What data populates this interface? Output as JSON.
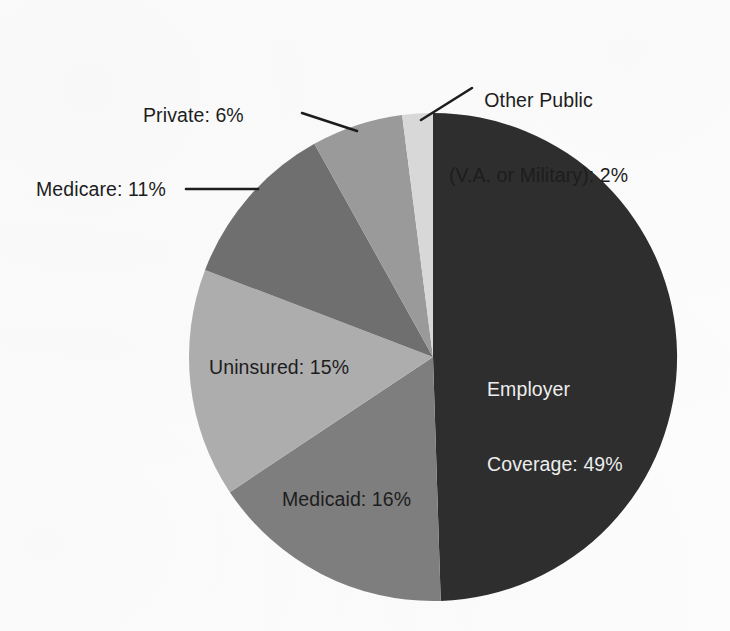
{
  "chart_data": {
    "type": "pie",
    "title": "",
    "subtitle": "",
    "xlabel": "",
    "ylabel": "",
    "unit": "%",
    "legend_position": "none",
    "grid": false,
    "start_angle_deg": 0,
    "direction": "clockwise",
    "categories": [
      "Employer Coverage",
      "Medicaid",
      "Uninsured",
      "Medicare",
      "Private",
      "Other Public (V.A. or Military)"
    ],
    "values": [
      49,
      16,
      15,
      11,
      6,
      2
    ],
    "slices": [
      {
        "name": "Employer Coverage",
        "label": "Employer\nCoverage: 49%",
        "label_line_1": "Employer",
        "label_line_2": "Coverage: 49%",
        "value": 49,
        "value_text": "49%",
        "color": "#2e2e2e",
        "label_placement": "inside",
        "label_color": "#ededed",
        "leader_line": false
      },
      {
        "name": "Medicaid",
        "label": "Medicaid: 16%",
        "value": 16,
        "value_text": "16%",
        "color": "#7e7e7e",
        "label_placement": "inside",
        "label_color": "#1d1d1d",
        "leader_line": false
      },
      {
        "name": "Uninsured",
        "label": "Uninsured: 15%",
        "value": 15,
        "value_text": "15%",
        "color": "#adadad",
        "label_placement": "inside",
        "label_color": "#1d1d1d",
        "leader_line": false
      },
      {
        "name": "Medicare",
        "label": "Medicare: 11%",
        "value": 11,
        "value_text": "11%",
        "color": "#6f6f6f",
        "label_placement": "outside",
        "label_color": "#1d1d1d",
        "leader_line": true
      },
      {
        "name": "Private",
        "label": "Private: 6%",
        "value": 6,
        "value_text": "6%",
        "color": "#9a9a9a",
        "label_placement": "outside",
        "label_color": "#1d1d1d",
        "leader_line": true
      },
      {
        "name": "Other Public (V.A. or Military)",
        "label": "Other Public\n(V.A. or Military): 2%",
        "label_line_1": "Other Public",
        "label_line_2": "(V.A. or Military): 2%",
        "value": 2,
        "value_text": "2%",
        "color": "#d8d8d8",
        "label_placement": "outside",
        "label_color": "#1d1d1d",
        "leader_line": true
      }
    ],
    "total": 99,
    "colors": {
      "employer": "#2e2e2e",
      "medicaid": "#7e7e7e",
      "uninsured": "#adadad",
      "medicare": "#6f6f6f",
      "private": "#9a9a9a",
      "other_public": "#d8d8d8",
      "background": "#fdfdfd",
      "leader_line": "#1d1d1d",
      "label_dark": "#1d1d1d",
      "label_light": "#ededed"
    }
  }
}
